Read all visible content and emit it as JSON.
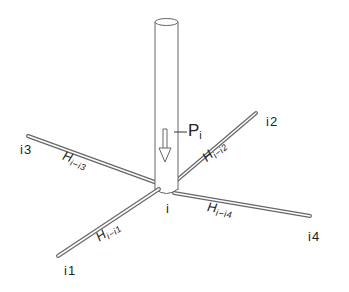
{
  "diagram": {
    "type": "structural-node",
    "column": {
      "load_label": "P",
      "load_subscript": "i"
    },
    "center_node": {
      "label": "i"
    },
    "members": [
      {
        "id": "i1",
        "node_label": "i1",
        "h_label": "H",
        "h_subscript": "i−i1"
      },
      {
        "id": "i2",
        "node_label": "i2",
        "h_label": "H",
        "h_subscript": "i−i2"
      },
      {
        "id": "i3",
        "node_label": "i3",
        "h_label": "H",
        "h_subscript": "i−i3"
      },
      {
        "id": "i4",
        "node_label": "i4",
        "h_label": "H",
        "h_subscript": "i−i4"
      }
    ],
    "colors": {
      "stroke": "#555555",
      "fill": "#ffffff",
      "text": "#222222"
    }
  }
}
